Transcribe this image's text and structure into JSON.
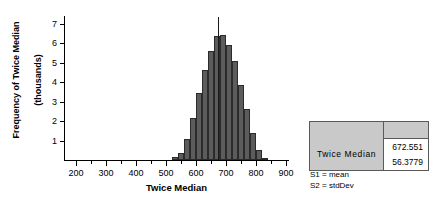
{
  "chart_data": {
    "type": "bar",
    "title": "",
    "xlabel": "Twice Median",
    "ylabel": "Frequency of Twice Median\n(thousands)",
    "ylabel_line1": "Frequency of Twice Median",
    "ylabel_line2": "(thousands)",
    "xlim": [
      160,
      910
    ],
    "ylim": [
      0,
      7.4
    ],
    "grid": false,
    "legend": "none",
    "x_ticks_major": [
      200,
      300,
      400,
      500,
      600,
      700,
      800,
      900
    ],
    "x_ticks_major_labels": [
      "200",
      "300",
      "400",
      "500",
      "600",
      "700",
      "800",
      "900"
    ],
    "x_ticks_minor": [
      250,
      350,
      450,
      550,
      650,
      750,
      850
    ],
    "y_ticks": [
      1,
      2,
      3,
      4,
      5,
      6,
      7
    ],
    "y_tick_labels": [
      "1",
      "2",
      "3",
      "4",
      "5",
      "6",
      "7"
    ],
    "bin_width": 20,
    "bar_color": "#5c5c5c",
    "bar_edge_color": "#2b2b2b",
    "bins": [
      {
        "x0": 520,
        "x1": 540,
        "value": 0.18
      },
      {
        "x0": 540,
        "x1": 560,
        "value": 0.38
      },
      {
        "x0": 560,
        "x1": 580,
        "value": 1.1
      },
      {
        "x0": 580,
        "x1": 600,
        "value": 2.18
      },
      {
        "x0": 600,
        "x1": 620,
        "value": 3.42
      },
      {
        "x0": 620,
        "x1": 640,
        "value": 4.62
      },
      {
        "x0": 640,
        "x1": 660,
        "value": 5.6
      },
      {
        "x0": 660,
        "x1": 680,
        "value": 6.38
      },
      {
        "x0": 680,
        "x1": 700,
        "value": 6.42
      },
      {
        "x0": 700,
        "x1": 720,
        "value": 5.92
      },
      {
        "x0": 720,
        "x1": 740,
        "value": 5.1
      },
      {
        "x0": 740,
        "x1": 760,
        "value": 3.85
      },
      {
        "x0": 760,
        "x1": 780,
        "value": 2.62
      },
      {
        "x0": 780,
        "x1": 800,
        "value": 1.38
      },
      {
        "x0": 800,
        "x1": 820,
        "value": 0.52
      },
      {
        "x0": 820,
        "x1": 840,
        "value": 0.12
      }
    ],
    "median_marker": {
      "x": 672.551,
      "y_top": 7.35
    }
  },
  "stats_table": {
    "header": [
      "",
      ""
    ],
    "row_label": "Twice  Median",
    "values": [
      "672.551",
      "56.3779"
    ]
  },
  "footnotes": [
    "S1 = mean",
    "S2 = stdDev"
  ],
  "colors": {
    "bar": "#5c5c5c",
    "bar_edge": "#2b2b2b",
    "table_bg": "#c9c9c9",
    "table_border": "#5a5a5a",
    "axis": "#000000"
  }
}
